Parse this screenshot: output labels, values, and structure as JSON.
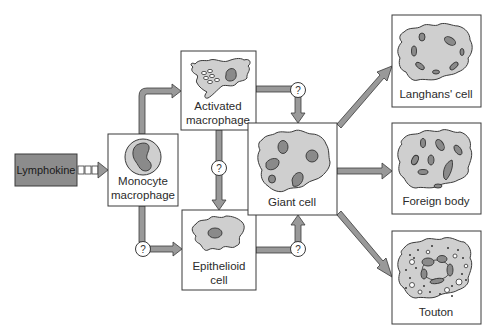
{
  "diagram": {
    "type": "flowchart",
    "background": "#ffffff",
    "colors": {
      "box_stroke": "#3a3a3a",
      "arrow_fill": "#999999",
      "cytoplasm": "#cfcfcf",
      "nucleus": "#8a8a8a",
      "lymphokine_fill": "#8c8c8c"
    },
    "nodes": {
      "lymphokine": {
        "label": "Lymphokine"
      },
      "monocyte": {
        "label_line1": "Monocyte",
        "label_line2": "macrophage"
      },
      "activated": {
        "label_line1": "Activated",
        "label_line2": "macrophage"
      },
      "epithelioid": {
        "label_line1": "Epithelioid",
        "label_line2": "cell"
      },
      "giant": {
        "label": "Giant cell"
      },
      "langhans": {
        "label": "Langhans' cell"
      },
      "foreign": {
        "label": "Foreign body"
      },
      "touton": {
        "label": "Touton"
      }
    },
    "unknown_marker": "?",
    "edges": [
      {
        "from": "Lymphokine",
        "to": "Monocyte macrophage",
        "style": "dashed-block"
      },
      {
        "from": "Monocyte macrophage",
        "to": "Activated macrophage",
        "marker": ""
      },
      {
        "from": "Monocyte macrophage",
        "to": "Epithelioid cell",
        "marker": "?"
      },
      {
        "from": "Activated macrophage",
        "to": "Epithelioid cell",
        "marker": "?"
      },
      {
        "from": "Activated macrophage",
        "to": "Giant cell",
        "marker": "?"
      },
      {
        "from": "Epithelioid cell",
        "to": "Giant cell",
        "marker": "?"
      },
      {
        "from": "Giant cell",
        "to": "Langhans' cell",
        "marker": ""
      },
      {
        "from": "Giant cell",
        "to": "Foreign body",
        "marker": ""
      },
      {
        "from": "Giant cell",
        "to": "Touton",
        "marker": ""
      }
    ]
  }
}
